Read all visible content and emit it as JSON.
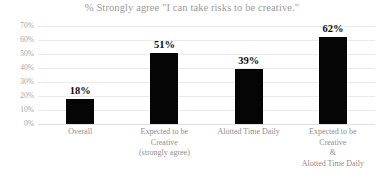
{
  "chart_data": {
    "type": "bar",
    "title": "% Strongly agree \"I can take risks to be creative.\"",
    "xlabel": "",
    "ylabel": "",
    "ylim": [
      0,
      70
    ],
    "grid": true,
    "legend": "none",
    "categories": [
      "Overall",
      "Expected to be Creative (strongly agree)",
      "Alotted Time Daily",
      "Expected to be Creative & Alotted Time Daily"
    ],
    "category_lines": [
      [
        "Overall"
      ],
      [
        "Expected to be",
        "Creative",
        "(strongly agree)"
      ],
      [
        "Alotted Time Daily"
      ],
      [
        "Expected to be",
        "Creative",
        "&",
        "Alotted Time Daily"
      ]
    ],
    "values": [
      18,
      51,
      39,
      62
    ],
    "value_labels": [
      "18%",
      "51%",
      "39%",
      "62%"
    ],
    "ytick_values": [
      70,
      60,
      50,
      40,
      30,
      20,
      10,
      0
    ],
    "ytick_labels": [
      "70%",
      "60%",
      "50%",
      "40%",
      "30%",
      "20%",
      "10%",
      "0%"
    ],
    "bar_color": "#050505",
    "gridline_color": "#eceaea",
    "axis_text_color": "#a8a6a6",
    "title_color": "#9a9a9a",
    "background_color": "#ffffff"
  }
}
